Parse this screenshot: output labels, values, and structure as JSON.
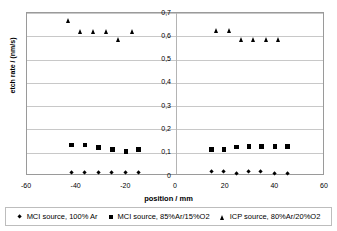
{
  "chart_data": {
    "type": "scatter",
    "title": "",
    "xlabel": "position / mm",
    "ylabel": "etch rate / (nm/s)",
    "xlim": [
      -60,
      60
    ],
    "ylim": [
      0,
      0.7
    ],
    "grid": true,
    "grid_axis": "y",
    "legend_position": "bottom",
    "xticks": [
      "-60",
      "-40",
      "-20",
      "0",
      "20",
      "40",
      "60"
    ],
    "xtick_values": [
      -60,
      -40,
      -20,
      0,
      20,
      40,
      60
    ],
    "yticks": [
      "0",
      "0,1",
      "0,2",
      "0,3",
      "0,4",
      "0,5",
      "0,6",
      "0,7"
    ],
    "ytick_values": [
      0,
      0.1,
      0.2,
      0.3,
      0.4,
      0.5,
      0.6,
      0.7
    ],
    "decimal_separator": ",",
    "series": [
      {
        "name": "MCI source, 100% Ar",
        "marker": "diamond",
        "color": "#000000",
        "points": [
          {
            "x": -42.0,
            "y": 0.012
          },
          {
            "x": -36.5,
            "y": 0.013
          },
          {
            "x": -31.0,
            "y": 0.013
          },
          {
            "x": -25.5,
            "y": 0.013
          },
          {
            "x": -20.0,
            "y": 0.013
          },
          {
            "x": -15.0,
            "y": 0.013
          },
          {
            "x": 14.5,
            "y": 0.018
          },
          {
            "x": 19.5,
            "y": 0.017
          },
          {
            "x": 24.5,
            "y": 0.007
          },
          {
            "x": 29.5,
            "y": 0.018
          },
          {
            "x": 34.5,
            "y": 0.017
          },
          {
            "x": 40.0,
            "y": 0.007
          },
          {
            "x": 45.0,
            "y": 0.008
          }
        ]
      },
      {
        "name": "MCI source, 85%Ar/15%O2",
        "marker": "square",
        "color": "#000000",
        "points": [
          {
            "x": -42.0,
            "y": 0.132
          },
          {
            "x": -36.5,
            "y": 0.131
          },
          {
            "x": -31.0,
            "y": 0.122
          },
          {
            "x": -25.5,
            "y": 0.113
          },
          {
            "x": -20.0,
            "y": 0.103
          },
          {
            "x": -15.0,
            "y": 0.112
          },
          {
            "x": 14.5,
            "y": 0.113
          },
          {
            "x": 19.5,
            "y": 0.113
          },
          {
            "x": 24.5,
            "y": 0.124
          },
          {
            "x": 29.5,
            "y": 0.125
          },
          {
            "x": 34.5,
            "y": 0.125
          },
          {
            "x": 40.0,
            "y": 0.125
          },
          {
            "x": 45.0,
            "y": 0.125
          }
        ]
      },
      {
        "name": "ICP source, 80%Ar/20%O2",
        "marker": "triangle",
        "color": "#000000",
        "points": [
          {
            "x": -43.0,
            "y": 0.668
          },
          {
            "x": -38.5,
            "y": 0.622
          },
          {
            "x": -33.0,
            "y": 0.622
          },
          {
            "x": -28.0,
            "y": 0.622
          },
          {
            "x": -23.0,
            "y": 0.585
          },
          {
            "x": -17.5,
            "y": 0.622
          },
          {
            "x": 16.5,
            "y": 0.625
          },
          {
            "x": 21.5,
            "y": 0.625
          },
          {
            "x": 26.5,
            "y": 0.585
          },
          {
            "x": 31.5,
            "y": 0.585
          },
          {
            "x": 36.5,
            "y": 0.585
          },
          {
            "x": 41.5,
            "y": 0.585
          }
        ]
      }
    ]
  },
  "legend": {
    "items": [
      {
        "marker": "diamond",
        "label": "MCI source, 100% Ar"
      },
      {
        "marker": "square",
        "label": "MCI source, 85%Ar/15%O2"
      },
      {
        "marker": "triangle",
        "label": "ICP source, 80%Ar/20%O2"
      }
    ]
  }
}
